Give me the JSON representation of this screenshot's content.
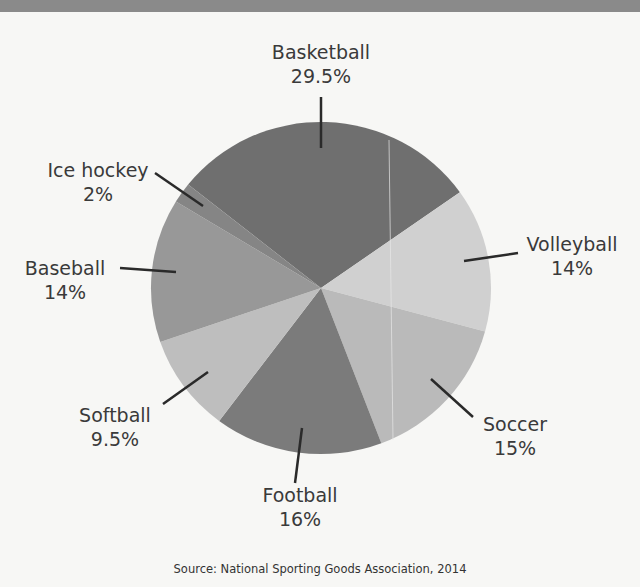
{
  "chart_data": {
    "type": "pie",
    "title": "",
    "categories": [
      "Basketball",
      "Volleyball",
      "Soccer",
      "Football",
      "Softball",
      "Baseball",
      "Ice hockey"
    ],
    "values": [
      29.5,
      14,
      15,
      16,
      9.5,
      14,
      2
    ],
    "value_labels": [
      "29.5%",
      "14%",
      "15%",
      "16%",
      "9.5%",
      "14%",
      "2%"
    ],
    "colors": [
      "#6f6f6f",
      "#d0d0d0",
      "#bababa",
      "#7b7b7b",
      "#bebebe",
      "#989898",
      "#858585"
    ],
    "start_angle_deg": -51.4,
    "direction": "clockwise",
    "legend": "none (callout labels)",
    "source": "Source: National Sporting Goods Association, 2014"
  },
  "labels": {
    "basketball": {
      "name": "Basketball",
      "pct": "29.5%"
    },
    "volleyball": {
      "name": "Volleyball",
      "pct": "14%"
    },
    "soccer": {
      "name": "Soccer",
      "pct": "15%"
    },
    "football": {
      "name": "Football",
      "pct": "16%"
    },
    "softball": {
      "name": "Softball",
      "pct": "9.5%"
    },
    "baseball": {
      "name": "Baseball",
      "pct": "14%"
    },
    "icehockey": {
      "name": "Ice hockey",
      "pct": "2%"
    }
  },
  "source": "Source: National Sporting Goods Association, 2014"
}
